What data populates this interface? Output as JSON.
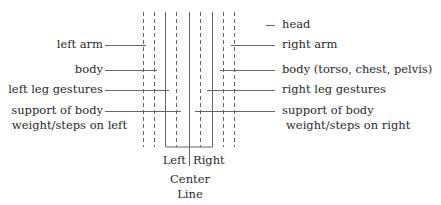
{
  "diagram": {
    "type": "labanotation-staff-columns",
    "left_labels": {
      "arm": "left arm",
      "body": "body",
      "leg": "left leg gestures",
      "support_1": "support of body",
      "support_2": "weight/steps on left"
    },
    "right_labels": {
      "head": "head",
      "arm": "right arm",
      "body": "body (torso, chest, pelvis)",
      "leg": "right leg gestures",
      "support_1": "support of body",
      "support_2": "weight/steps on right"
    },
    "bottom_labels": {
      "left": "Left",
      "right": "Right",
      "center_1": "Center",
      "center_2": "Line"
    },
    "colors": {
      "line": "#555555",
      "text": "#2a2a2a"
    }
  }
}
